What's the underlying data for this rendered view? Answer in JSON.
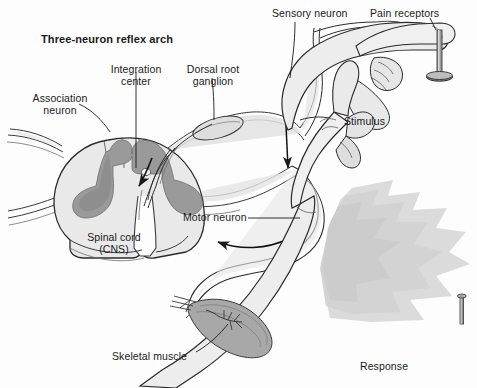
{
  "figure": {
    "title": "Three-neuron reflex arch",
    "kind": "anatomical-diagram"
  },
  "labels": {
    "title": "Three-neuron reflex arch",
    "association_neuron": "Association\nneuron",
    "integration_center": "Integration\ncenter",
    "dorsal_root_ganglion": "Dorsal root\nganglion",
    "sensory_neuron": "Sensory neuron",
    "pain_receptors": "Pain receptors",
    "stimulus": "Stimulus",
    "spinal_cord": "Spinal cord\n(CNS)",
    "motor_neuron": "Motor neuron",
    "skeletal_muscle": "Skeletal muscle",
    "response": "Response"
  },
  "colors": {
    "background": "#fdfdfd",
    "ink": "#1a1a1a",
    "outline": "#2b2b2b",
    "white_matter": "#e9e9e9",
    "gray_matter": "#9a9a9a",
    "gray_matter_dark": "#8a8a8a",
    "skin": "#ededed",
    "skin_shade": "#d6d6d6",
    "nerve": "#dcdcdc",
    "muscle": "#a8a8a8",
    "muscle_dark": "#8f8f8f",
    "motion_shadow": "#c9c9c9",
    "tack": "#8f8f8f",
    "tack_dark": "#5d5d5d"
  },
  "arrows": [
    {
      "name": "sensory-direction-arrow",
      "direction": "down"
    },
    {
      "name": "motor-direction-arrow",
      "direction": "left"
    },
    {
      "name": "integration-direction-arrow",
      "direction": "down-left"
    }
  ]
}
